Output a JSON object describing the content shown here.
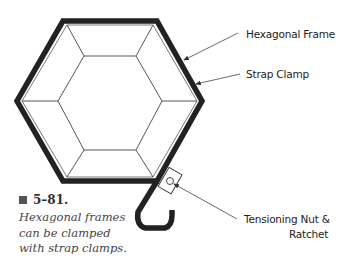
{
  "figure": {
    "number": "5–81.",
    "caption_lines": [
      "Hexagonal frames",
      "can be clamped",
      "with strap clamps."
    ]
  },
  "labels": {
    "hexagonal_frame": "Hexagonal Frame",
    "strap_clamp": "Strap Clamp",
    "tensioning_line1": "Tensioning Nut &",
    "tensioning_line2": "Ratchet"
  },
  "colors": {
    "strap": "#222222",
    "frame_lines": "#444444",
    "text": "#222222",
    "background": "#ffffff"
  }
}
